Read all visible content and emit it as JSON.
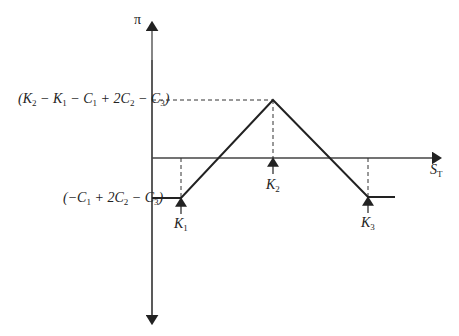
{
  "diagram": {
    "type": "payoff-diagram",
    "y_axis": {
      "label": "π"
    },
    "x_axis": {
      "label": "S",
      "label_sub": "T"
    },
    "y_labels": {
      "peak": {
        "parts": [
          "(K",
          "2",
          " − K",
          "1",
          " − C",
          "1",
          " + 2C",
          "2",
          " − C",
          "3",
          ")"
        ]
      },
      "floor": {
        "parts": [
          "(−C",
          "1",
          " + 2C",
          "2",
          " − C",
          "3",
          ")"
        ]
      }
    },
    "strikes": [
      {
        "name": "K",
        "sub": "1"
      },
      {
        "name": "K",
        "sub": "2"
      },
      {
        "name": "K",
        "sub": "3"
      }
    ],
    "colors": {
      "line": "#222222",
      "axis": "#444444"
    }
  }
}
